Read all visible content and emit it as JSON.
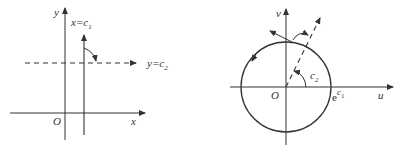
{
  "left_panel": {
    "title": "z-plane (xy)",
    "axis_x_label": "x",
    "axis_y_label": "y",
    "origin_label": "O",
    "vertical_line_label": "x=c",
    "vertical_line_sub": "1",
    "horizontal_line_label": "y=c",
    "horizontal_line_sub": "2"
  },
  "right_panel": {
    "title": "w-plane (uv)",
    "axis_u_label": "u",
    "axis_v_label": "v",
    "origin_label": "O",
    "radius_label": "e",
    "radius_sup": "c",
    "radius_sup_sub": "1",
    "angle_label": "c",
    "angle_sub": "2"
  },
  "colors": {
    "stroke": "#333333",
    "background": "#ffffff"
  }
}
